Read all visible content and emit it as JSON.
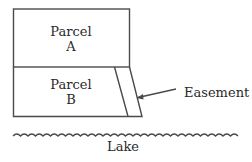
{
  "diagram": {
    "parcels": [
      {
        "id": "A",
        "label_line1": "Parcel",
        "label_line2": "A"
      },
      {
        "id": "B",
        "label_line1": "Parcel",
        "label_line2": "B"
      }
    ],
    "easement_label": "Easement",
    "lake_label": "Lake",
    "colors": {
      "line": "#4a4a4a",
      "text": "#2a2a2a",
      "background": "#ffffff"
    }
  }
}
